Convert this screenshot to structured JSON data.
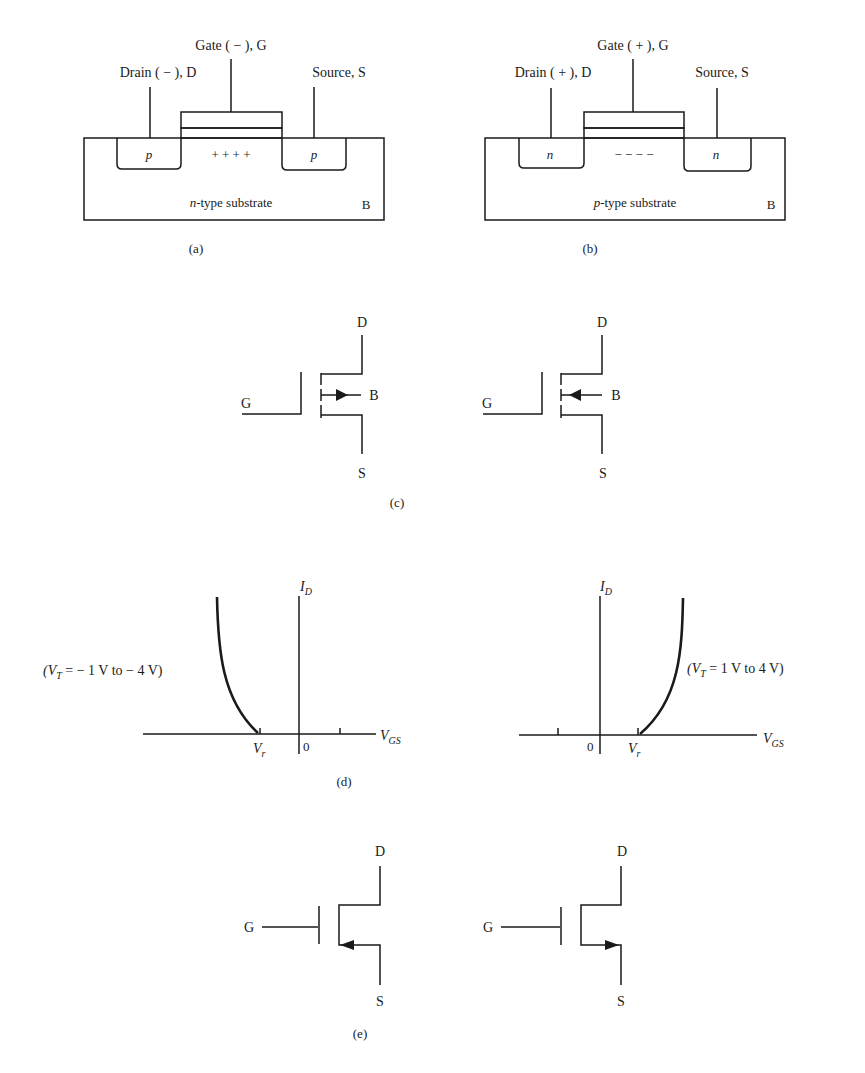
{
  "figure": {
    "panel_a": {
      "caption": "(a)",
      "gate_label": "Gate ( − ), G",
      "drain_label": "Drain ( − ), D",
      "source_label": "Source, S",
      "drain_region": "p",
      "source_region": "p",
      "channel_charges": "+ + + +",
      "substrate_prefix": "n",
      "substrate_label": "-type substrate",
      "body_label": "B"
    },
    "panel_b": {
      "caption": "(b)",
      "gate_label": "Gate ( + ), G",
      "drain_label": "Drain ( + ), D",
      "source_label": "Source, S",
      "drain_region": "n",
      "source_region": "n",
      "channel_charges": "− − − −",
      "substrate_prefix": "p",
      "substrate_label": "-type substrate",
      "body_label": "B"
    },
    "panel_c": {
      "caption": "(c)",
      "left": {
        "drain": "D",
        "gate": "G",
        "body": "B",
        "source": "S"
      },
      "right": {
        "drain": "D",
        "gate": "G",
        "body": "B",
        "source": "S"
      }
    },
    "panel_d": {
      "caption": "(d)",
      "left": {
        "y_axis": "I",
        "y_axis_sub": "D",
        "x_axis": "V",
        "x_axis_sub": "GS",
        "origin": "0",
        "vt_label": "V",
        "vt_sub": "r",
        "annotation_pre": "(V",
        "annotation_sub": "T",
        "annotation_post": " = − 1 V to − 4 V)"
      },
      "right": {
        "y_axis": "I",
        "y_axis_sub": "D",
        "x_axis": "V",
        "x_axis_sub": "GS",
        "origin": "0",
        "vt_label": "V",
        "vt_sub": "r",
        "annotation_pre": "(V",
        "annotation_sub": "T",
        "annotation_post": " = 1 V to 4 V)"
      }
    },
    "panel_e": {
      "caption": "(e)",
      "left": {
        "drain": "D",
        "gate": "G",
        "source": "S"
      },
      "right": {
        "drain": "D",
        "gate": "G",
        "source": "S"
      }
    }
  }
}
